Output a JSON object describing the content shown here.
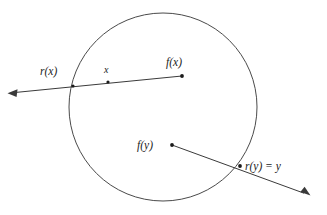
{
  "figure": {
    "kind": "geometric-diagram",
    "background_color": "#ffffff",
    "stroke_color": "#3a3a3a",
    "curve_color": "#4a4a4a",
    "label_color": "#1b1b1b"
  },
  "shapes": {
    "circle": {
      "name": "disc-boundary",
      "cx": 163,
      "cy": 107,
      "r": 94
    }
  },
  "rays": [
    {
      "id": "ray-x",
      "start_x": 182,
      "start_y": 76,
      "end_x": 10,
      "end_y": 93,
      "arrow_at": "end"
    },
    {
      "id": "ray-y",
      "start_x": 172,
      "start_y": 145,
      "end_x": 309,
      "end_y": 195,
      "arrow_at": "end"
    }
  ],
  "points": [
    {
      "id": "point-rx",
      "label": "r(x)",
      "x": 73,
      "y": 86,
      "label_x": 40,
      "label_y": 74,
      "anchor": "start"
    },
    {
      "id": "point-x",
      "label": "x",
      "x": 108,
      "y": 82,
      "label_x": 104,
      "label_y": 72,
      "anchor": "start"
    },
    {
      "id": "point-fx",
      "label": "f(x)",
      "x": 182,
      "y": 76,
      "label_x": 166,
      "label_y": 66,
      "anchor": "start"
    },
    {
      "id": "point-fy",
      "label": "f(y)",
      "x": 172,
      "y": 145,
      "label_x": 138,
      "label_y": 149,
      "anchor": "start"
    },
    {
      "id": "point-ry",
      "label": "r(y) = y",
      "x": 240,
      "y": 166,
      "label_x": 244,
      "label_y": 170,
      "anchor": "start"
    }
  ],
  "labels": {
    "rx": "r(x)",
    "x": "x",
    "fx": "f(x)",
    "fy": "f(y)",
    "ry_equals_y": "r(y) = y"
  }
}
